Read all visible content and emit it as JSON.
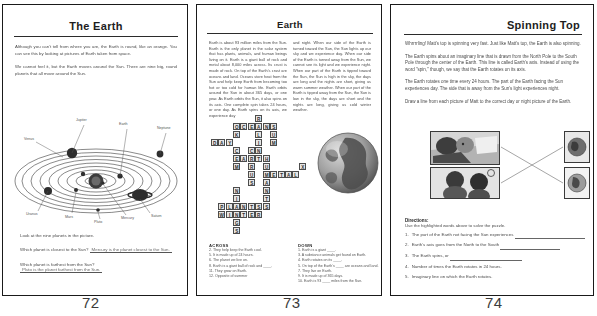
{
  "document": {
    "type": "scanned-worksheet-spread",
    "page_count": 3
  },
  "pages": [
    {
      "number": "72",
      "title": "The Earth",
      "paragraphs": [
        "Although you can't tell from where you are, the Earth is round, like an orange. You can see this by looking at pictures of Earth taken from space.",
        "We cannot feel it, but the Earth moves around the Sun. There are nine big, round planets that all move around the Sun."
      ],
      "figure": {
        "name": "solar-system-diagram",
        "caption": "Look at the nine planets in the picture.",
        "planet_labels": [
          "Jupiter",
          "Earth",
          "Neptune",
          "Venus",
          "Uranus",
          "Mars",
          "Pluto",
          "Mercury",
          "Saturn"
        ]
      },
      "questions": [
        {
          "prompt": "Which planet is closest to the Sun?",
          "answer": "Mercury is the planet closest to the Sun."
        },
        {
          "prompt": "Which planet is farthest from the Sun?",
          "answer": "Pluto is the planet farthest from the Sun."
        }
      ]
    },
    {
      "number": "73",
      "title": "Earth",
      "columns": [
        "Earth is about 93 million miles from the Sun. Earth is the only planet in the solar system that has plants, animals, and human beings living on it. Earth is a giant ball of rock and metal about 8,000 miles across. Its crust is made of rock. On top of the Earth's crust are oceans and land. Oceans store heat from the Sun and help keep Earth from becoming too hot or too cold for human life. Earth orbits around the Sun in about 365 days, or one year. As Earth orbits the Sun, it also spins on its axis. One complete spin takes 24 hours, or one day. As Earth spins on its axis, we experience day",
        "and night. When our side of the Earth is turned toward the Sun, the Sun lights up our sky and we experience day. When our side of the Earth is turned away from the Sun, we cannot see its light and we experience night. When our part of the Earth is tipped toward the Sun, the Sun is high in the sky, the days are long and the nights are short, giving us warm summer weather. When our part of the Earth is tipped away from the Sun, the Sun is low in the sky, the days are short and the nights are long, giving us cold winter weather."
      ],
      "crossword": {
        "name": "earth-crossword-puzzle",
        "grid_words": [
          "OCEANS",
          "DAY",
          "EARTH",
          "METAL",
          "PLANTS",
          "WINTER"
        ],
        "across_heading": "ACROSS",
        "across": [
          "2. They help keep the Earth cool.",
          "5. It is made up of 24 hours.",
          "6. The planet we live on.",
          "8. Earth is a giant ball of rock and ____.",
          "11. They grow on Earth.",
          "12. Opposite of summer"
        ],
        "down_heading": "DOWN",
        "down": [
          "1. Earth is a giant ____.",
          "3. A substance animals get found on Earth.",
          "4. Earth rotates on its ____.",
          "5. On top of the Earth's ____ are oceans and land.",
          "7. They live on Earth.",
          "9. It is made up of 365 days.",
          "10. Earth is 93 ____ miles from the Sun."
        ]
      },
      "photo": {
        "name": "earth-globe-photo",
        "alt": "Photograph of the Earth globe"
      }
    },
    {
      "number": "74",
      "title": "Spinning Top",
      "paragraphs": [
        "Whrrrrling! Matt's top is spinning very fast. Just like Matt's top, the Earth is also spinning.",
        "The Earth spins about an imaginary line that is drawn from the North Pole to the South Pole through the center of the Earth. This line is called Earth's axis. Instead of using the word \"spin,\" though, we say that the Earth rotates on its axis.",
        "The Earth rotates one time every 24 hours. The part of the Earth facing the Sun experiences day. The side that is away from the Sun's light experiences night.",
        "Draw a line from each picture of Matt to the correct day or night picture of the Earth."
      ],
      "activity": {
        "name": "matching-activity",
        "left_images": [
          "matt-sleeping-night-photo",
          "matt-daytime-photo"
        ],
        "right_images": [
          "earth-night-picture",
          "earth-day-picture"
        ]
      },
      "directions_heading": "Directions:",
      "directions_sub": "Use the highlighted words above to solve the puzzle.",
      "tasks": [
        {
          "num": "1.",
          "text": "The part of the Earth not facing the Sun experiences"
        },
        {
          "num": "2.",
          "text": "Earth's axis goes from the North to the South"
        },
        {
          "num": "3.",
          "text": "The Earth spins, or"
        },
        {
          "num": "4.",
          "text": "Number of times the Earth rotates in 24 hours."
        },
        {
          "num": "5.",
          "text": "Imaginary line on which the Earth rotates."
        }
      ]
    }
  ],
  "colors": {
    "ink": "#2b2b2b",
    "body_text": "#4a4a4a",
    "paper": "#ffffff"
  }
}
